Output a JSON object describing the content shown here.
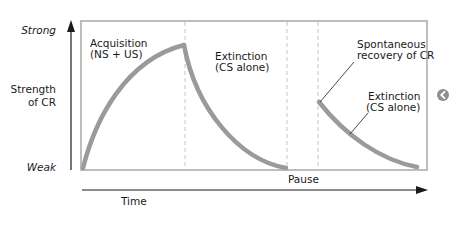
{
  "y_axis": {
    "top_label": "Strong",
    "bottom_label": "Weak",
    "title_line1": "Strength",
    "title_line2": "of CR"
  },
  "x_axis": {
    "title": "Time",
    "pause_label": "Pause"
  },
  "phases": [
    {
      "label_line1": "Acquisition",
      "label_line2": "(NS + US)"
    },
    {
      "label_line1": "Extinction",
      "label_line2": "(CS alone)"
    },
    {
      "label_line1": "Spontaneous",
      "label_line2": "recovery of CR"
    },
    {
      "label_line1": "Extinction",
      "label_line2": "(CS alone)"
    }
  ],
  "colors": {
    "curve": "#9a9a9a",
    "box": "#bdbdbd",
    "dash": "#c4c4c4",
    "axis": "#1a1a1a",
    "text": "#1a1a1a"
  },
  "side_icon": "circled-left-arrow-icon"
}
